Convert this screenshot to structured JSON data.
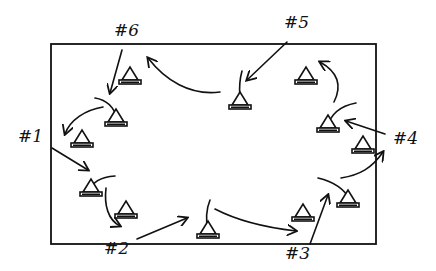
{
  "diagram": {
    "type": "hand-drawn drill layout",
    "colors": {
      "ink": "#111111",
      "background": "#ffffff"
    },
    "field": {
      "x": 51,
      "y": 44,
      "width": 325,
      "height": 200
    },
    "stations": [
      {
        "id": "1",
        "label": "#1",
        "x": 18,
        "y": 128
      },
      {
        "id": "2",
        "label": "#2",
        "x": 104,
        "y": 240
      },
      {
        "id": "3",
        "label": "#3",
        "x": 285,
        "y": 246
      },
      {
        "id": "4",
        "label": "#4",
        "x": 394,
        "y": 132
      },
      {
        "id": "5",
        "label": "#5",
        "x": 290,
        "y": 16
      },
      {
        "id": "6",
        "label": "#6",
        "x": 116,
        "y": 22
      }
    ],
    "cones": [
      {
        "name": "cone-top-left-upper",
        "x": 130,
        "y": 80
      },
      {
        "name": "cone-top-left-lower",
        "x": 116,
        "y": 118
      },
      {
        "name": "cone-left-mid",
        "x": 82,
        "y": 140
      },
      {
        "name": "cone-left-low",
        "x": 94,
        "y": 192
      },
      {
        "name": "cone-bottom-left",
        "x": 126,
        "y": 212
      },
      {
        "name": "cone-bottom-center",
        "x": 208,
        "y": 232
      },
      {
        "name": "cone-bottom-right",
        "x": 304,
        "y": 215
      },
      {
        "name": "cone-right-low",
        "x": 348,
        "y": 200
      },
      {
        "name": "cone-right-mid",
        "x": 360,
        "y": 148
      },
      {
        "name": "cone-right-upper",
        "x": 328,
        "y": 125
      },
      {
        "name": "cone-top-right",
        "x": 306,
        "y": 78
      },
      {
        "name": "cone-top-center",
        "x": 240,
        "y": 100
      }
    ]
  }
}
